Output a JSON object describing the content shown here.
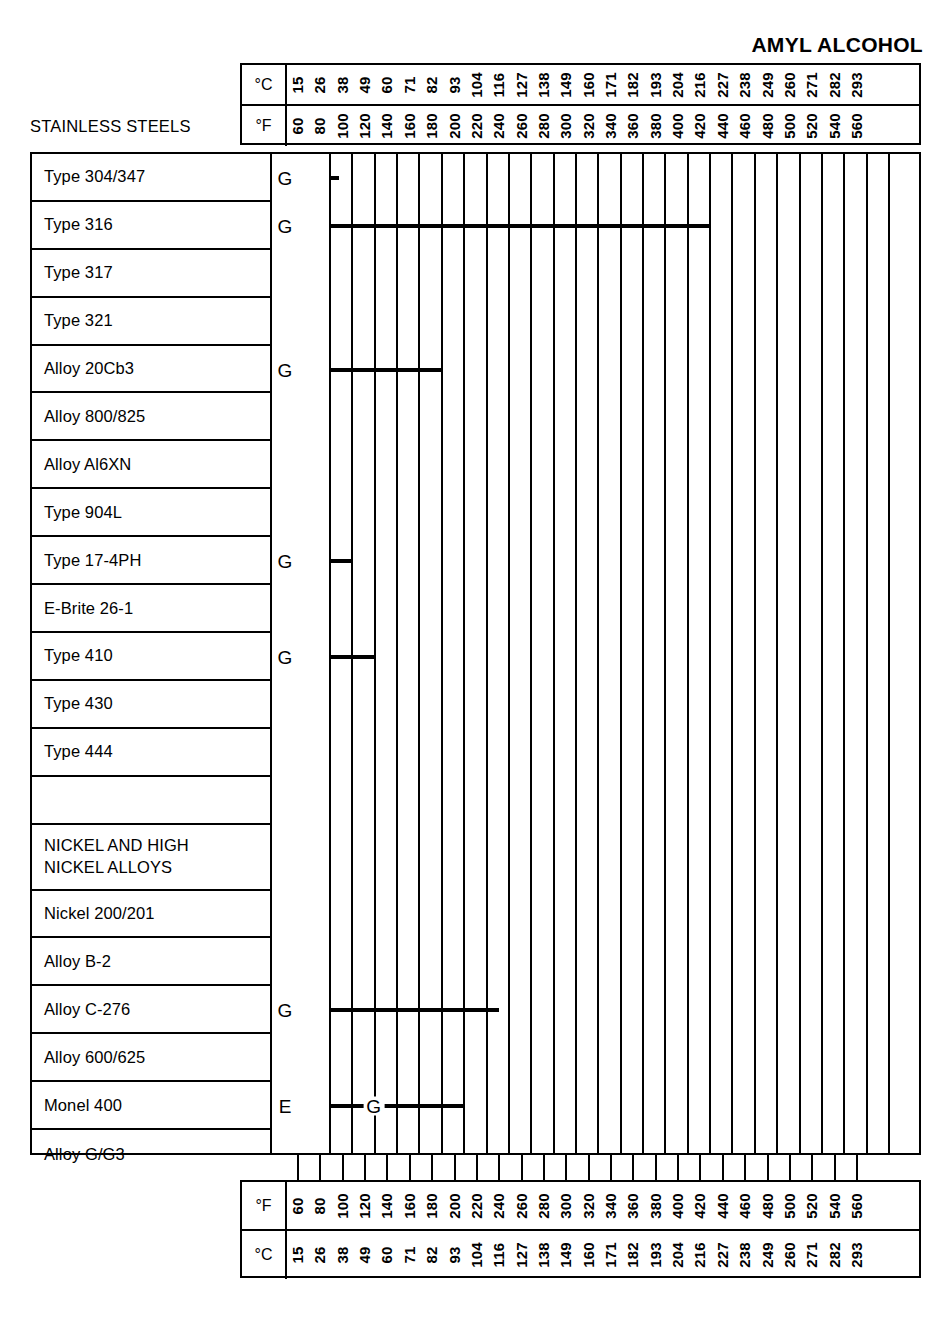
{
  "title": "AMYL ALCOHOL",
  "category_caption": "STAINLESS STEELS",
  "units": {
    "celsius": "°C",
    "fahrenheit": "°F"
  },
  "legend_codes": {
    "excellent": "E",
    "good": "G"
  },
  "chart_data": {
    "type": "bar",
    "title": "AMYL ALCOHOL",
    "xlabel": "Temperature",
    "ylabel": "Alloy",
    "axis_fahrenheit": [
      60,
      80,
      100,
      120,
      140,
      160,
      180,
      200,
      220,
      240,
      260,
      280,
      300,
      320,
      340,
      360,
      380,
      400,
      420,
      440,
      460,
      480,
      500,
      520,
      540,
      560
    ],
    "axis_celsius": [
      15,
      26,
      38,
      49,
      60,
      71,
      82,
      93,
      104,
      116,
      127,
      138,
      149,
      160,
      171,
      182,
      193,
      204,
      216,
      227,
      238,
      249,
      260,
      271,
      282,
      293
    ],
    "xlim_f": [
      60,
      560
    ],
    "grid": true,
    "rating_codes": [
      "E",
      "G"
    ],
    "categories": [
      "Type 304/347",
      "Type 316",
      "Type 317",
      "Type 321",
      "Alloy 20Cb3",
      "Alloy 800/825",
      "Alloy Al6XN",
      "Type 904L",
      "Type 17-4PH",
      "E-Brite 26-1",
      "Type 410",
      "Type 430",
      "Type 444",
      "",
      "NICKEL AND HIGH NICKEL ALLOYS",
      "Nickel 200/201",
      "Alloy B-2",
      "Alloy C-276",
      "Alloy 600/625",
      "Monel 400",
      "Alloy G/G3"
    ],
    "series": [
      {
        "name": "Type 304/347",
        "segments": [
          {
            "rating": "G",
            "start_f": 60,
            "end_f": 70,
            "start_c": 15,
            "end_c": 21
          }
        ]
      },
      {
        "name": "Type 316",
        "segments": [
          {
            "rating": "G",
            "start_f": 60,
            "end_f": 400,
            "start_c": 15,
            "end_c": 204
          }
        ]
      },
      {
        "name": "Type 317",
        "segments": []
      },
      {
        "name": "Type 321",
        "segments": []
      },
      {
        "name": "Alloy 20Cb3",
        "segments": [
          {
            "rating": "G",
            "start_f": 60,
            "end_f": 160,
            "start_c": 15,
            "end_c": 71
          }
        ]
      },
      {
        "name": "Alloy 800/825",
        "segments": []
      },
      {
        "name": "Alloy Al6XN",
        "segments": []
      },
      {
        "name": "Type 904L",
        "segments": []
      },
      {
        "name": "Type 17-4PH",
        "segments": [
          {
            "rating": "G",
            "start_f": 60,
            "end_f": 80,
            "start_c": 15,
            "end_c": 26
          }
        ]
      },
      {
        "name": "E-Brite 26-1",
        "segments": []
      },
      {
        "name": "Type 410",
        "segments": [
          {
            "rating": "G",
            "start_f": 60,
            "end_f": 100,
            "start_c": 15,
            "end_c": 38
          }
        ]
      },
      {
        "name": "Type 430",
        "segments": []
      },
      {
        "name": "Type 444",
        "segments": []
      },
      {
        "name": "Nickel 200/201",
        "segments": []
      },
      {
        "name": "Alloy B-2",
        "segments": []
      },
      {
        "name": "Alloy C-276",
        "segments": [
          {
            "rating": "G",
            "start_f": 60,
            "end_f": 200,
            "start_c": 15,
            "end_c": 93
          }
        ]
      },
      {
        "name": "Alloy 600/625",
        "segments": []
      },
      {
        "name": "Monel 400",
        "segments": [
          {
            "rating": "E",
            "start_f": 60,
            "end_f": 100,
            "start_c": 15,
            "end_c": 38
          },
          {
            "rating": "G",
            "start_f": 100,
            "end_f": 180,
            "start_c": 38,
            "end_c": 82
          }
        ]
      },
      {
        "name": "Alloy G/G3",
        "segments": []
      }
    ]
  },
  "rows": [
    {
      "label": "Type 304/347",
      "kind": "alloy",
      "marker": "G",
      "bars": [
        {
          "from": 0,
          "to": 0.45
        }
      ],
      "seg_labels": []
    },
    {
      "label": "Type 316",
      "kind": "alloy",
      "marker": "G",
      "bars": [
        {
          "from": 0,
          "to": 17
        }
      ],
      "seg_labels": []
    },
    {
      "label": "Type 317",
      "kind": "alloy",
      "marker": "",
      "bars": [],
      "seg_labels": []
    },
    {
      "label": "Type 321",
      "kind": "alloy",
      "marker": "",
      "bars": [],
      "seg_labels": []
    },
    {
      "label": "Alloy 20Cb3",
      "kind": "alloy",
      "marker": "G",
      "bars": [
        {
          "from": 0,
          "to": 5
        }
      ],
      "seg_labels": []
    },
    {
      "label": "Alloy 800/825",
      "kind": "alloy",
      "marker": "",
      "bars": [],
      "seg_labels": []
    },
    {
      "label": "Alloy Al6XN",
      "kind": "alloy",
      "marker": "",
      "bars": [],
      "seg_labels": []
    },
    {
      "label": "Type 904L",
      "kind": "alloy",
      "marker": "",
      "bars": [],
      "seg_labels": []
    },
    {
      "label": "Type 17-4PH",
      "kind": "alloy",
      "marker": "G",
      "bars": [
        {
          "from": 0,
          "to": 1
        }
      ],
      "seg_labels": []
    },
    {
      "label": "E-Brite 26-1",
      "kind": "alloy",
      "marker": "",
      "bars": [],
      "seg_labels": []
    },
    {
      "label": "Type 410",
      "kind": "alloy",
      "marker": "G",
      "bars": [
        {
          "from": 0,
          "to": 2
        }
      ],
      "seg_labels": []
    },
    {
      "label": "Type 430",
      "kind": "alloy",
      "marker": "",
      "bars": [],
      "seg_labels": []
    },
    {
      "label": "Type 444",
      "kind": "alloy",
      "marker": "",
      "bars": [],
      "seg_labels": []
    },
    {
      "label": "",
      "kind": "spacer",
      "marker": "",
      "bars": [],
      "seg_labels": []
    },
    {
      "label": "NICKEL AND HIGH\nNICKEL ALLOYS",
      "kind": "grouphead",
      "marker": "",
      "bars": [],
      "seg_labels": []
    },
    {
      "label": "Nickel 200/201",
      "kind": "alloy",
      "marker": "",
      "bars": [],
      "seg_labels": []
    },
    {
      "label": "Alloy B-2",
      "kind": "alloy",
      "marker": "",
      "bars": [],
      "seg_labels": []
    },
    {
      "label": "Alloy C-276",
      "kind": "alloy",
      "marker": "G",
      "bars": [
        {
          "from": 0,
          "to": 7.6
        }
      ],
      "seg_labels": []
    },
    {
      "label": "Alloy 600/625",
      "kind": "alloy",
      "marker": "",
      "bars": [],
      "seg_labels": []
    },
    {
      "label": "Monel 400",
      "kind": "alloy",
      "marker": "E",
      "bars": [
        {
          "from": 0,
          "to": 2
        },
        {
          "from": 2,
          "to": 6
        }
      ],
      "seg_labels": [
        {
          "text": "G",
          "at": 2
        }
      ]
    },
    {
      "label": "Alloy G/G3",
      "kind": "alloy",
      "marker": "",
      "bars": [],
      "seg_labels": []
    }
  ]
}
